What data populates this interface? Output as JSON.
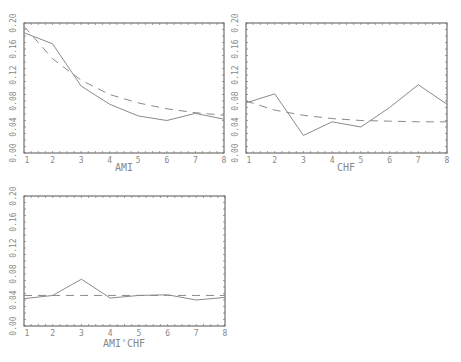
{
  "chart_data": [
    {
      "type": "line",
      "title": "",
      "xlabel": "AMI",
      "ylabel": "",
      "x": [
        1,
        2,
        3,
        4,
        5,
        6,
        7,
        8
      ],
      "xticks": [
        "1",
        "2",
        "3",
        "4",
        "5",
        "6",
        "7",
        "8"
      ],
      "yticks": [
        "0.00",
        "0.04",
        "0.08",
        "0.12",
        "0.16",
        "0.20"
      ],
      "ylim": [
        0,
        0.2
      ],
      "xlim": [
        1,
        8
      ],
      "grid": false,
      "series": [
        {
          "name": "observed",
          "style": "solid",
          "values": [
            0.185,
            0.168,
            0.103,
            0.075,
            0.057,
            0.05,
            0.061,
            0.052
          ]
        },
        {
          "name": "fitted",
          "style": "dashed",
          "values": [
            0.195,
            0.145,
            0.112,
            0.09,
            0.077,
            0.068,
            0.062,
            0.058
          ]
        }
      ]
    },
    {
      "type": "line",
      "title": "",
      "xlabel": "CHF",
      "ylabel": "",
      "x": [
        1,
        2,
        3,
        4,
        5,
        6,
        7,
        8
      ],
      "xticks": [
        "1",
        "2",
        "3",
        "4",
        "5",
        "6",
        "7",
        "8"
      ],
      "yticks": [
        "0.00",
        "0.04",
        "0.08",
        "0.12",
        "0.16",
        "0.20"
      ],
      "ylim": [
        0,
        0.2
      ],
      "xlim": [
        1,
        8
      ],
      "grid": false,
      "series": [
        {
          "name": "observed",
          "style": "solid",
          "values": [
            0.077,
            0.091,
            0.027,
            0.048,
            0.04,
            0.07,
            0.105,
            0.075
          ]
        },
        {
          "name": "fitted",
          "style": "dashed",
          "values": [
            0.08,
            0.066,
            0.058,
            0.053,
            0.05,
            0.049,
            0.048,
            0.048
          ]
        }
      ]
    },
    {
      "type": "line",
      "title": "",
      "xlabel": "AMI'CHF",
      "ylabel": "",
      "x": [
        1,
        2,
        3,
        4,
        5,
        6,
        7,
        8
      ],
      "xticks": [
        "1",
        "2",
        "3",
        "4",
        "5",
        "6",
        "7",
        "8"
      ],
      "yticks": [
        "0.00",
        "0.04",
        "0.08",
        "0.12",
        "0.16",
        "0.20"
      ],
      "ylim": [
        0,
        0.2
      ],
      "xlim": [
        1,
        8
      ],
      "grid": false,
      "series": [
        {
          "name": "observed",
          "style": "solid",
          "values": [
            0.042,
            0.047,
            0.072,
            0.043,
            0.047,
            0.048,
            0.04,
            0.044
          ]
        },
        {
          "name": "fitted",
          "style": "dashed",
          "values": [
            0.047,
            0.047,
            0.047,
            0.047,
            0.047,
            0.047,
            0.047,
            0.047
          ]
        }
      ]
    }
  ],
  "panels": [
    {
      "xlabel": "AMI"
    },
    {
      "xlabel": "CHF"
    },
    {
      "xlabel": "AMI'CHF"
    }
  ]
}
